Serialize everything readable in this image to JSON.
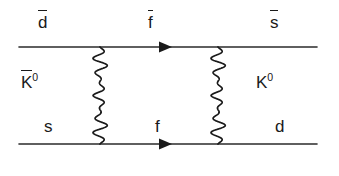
{
  "figure": {
    "kind": "feynman-diagram",
    "background_color": "#ffffff",
    "line_color": "#1a1a1a",
    "text_color": "#1a1a1a"
  },
  "labels": {
    "top_left": {
      "text": "d",
      "overline": true,
      "superscript": ""
    },
    "top_middle": {
      "text": "f",
      "overline": true,
      "superscript": ""
    },
    "top_right": {
      "text": "s",
      "overline": true,
      "superscript": ""
    },
    "left_meson": {
      "text": "K",
      "overline": true,
      "superscript": "0"
    },
    "right_meson": {
      "text": "K",
      "overline": false,
      "superscript": "0"
    },
    "bottom_left": {
      "text": "s",
      "overline": false,
      "superscript": ""
    },
    "bottom_middle": {
      "text": "f",
      "overline": false,
      "superscript": ""
    },
    "bottom_right": {
      "text": "d",
      "overline": false,
      "superscript": ""
    }
  },
  "geometry": {
    "top_fermion_line": {
      "x1": 19,
      "y1": 47,
      "x2": 317,
      "y2": 47
    },
    "bottom_fermion_line": {
      "x1": 19,
      "y1": 144,
      "x2": 317,
      "y2": 144
    },
    "top_arrow_x": 167,
    "bottom_arrow_x": 167,
    "left_boson_x": 100,
    "right_boson_x": 218,
    "boson_y_top": 47,
    "boson_y_bottom": 144,
    "boson_amplitude": 7.5,
    "boson_cycles": 6.5
  }
}
